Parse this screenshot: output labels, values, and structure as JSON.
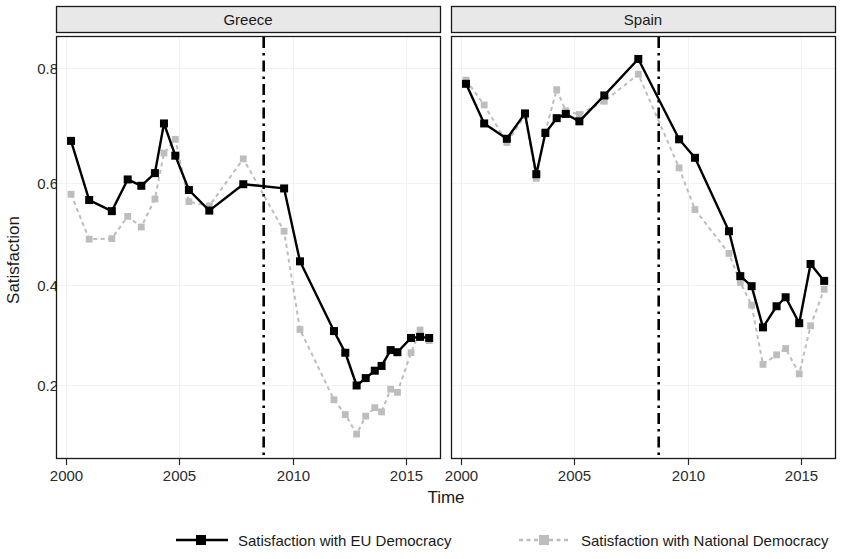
{
  "chart_data": {
    "type": "line",
    "title": "",
    "xlabel": "Time",
    "ylabel": "Satisfaction",
    "xlim": [
      1999.6,
      2016.6
    ],
    "ylim": [
      0.08,
      0.85
    ],
    "yticks": [
      0.2,
      0.4,
      0.6,
      0.8
    ],
    "ytick_labels": [
      "0.2",
      "0.4",
      "0.6",
      "0.8"
    ],
    "xticks": [
      2000,
      2005,
      2010,
      2015
    ],
    "xtick_labels": [
      "2000",
      "2005",
      "2010",
      "2015"
    ],
    "grid": true,
    "legend_position": "bottom",
    "facets": [
      "Greece",
      "Spain"
    ],
    "annotations": [
      {
        "type": "vline",
        "x": 2008.7,
        "style": "dash-dot",
        "color": "#000000",
        "panels": [
          "Greece",
          "Spain"
        ]
      }
    ],
    "panels": [
      {
        "name": "Greece",
        "series": [
          {
            "name": "Satisfaction with EU Democracy",
            "color": "#000000",
            "linestyle": "solid",
            "marker": "square",
            "x": [
              2000.2,
              2001.0,
              2002.0,
              2002.7,
              2003.3,
              2003.9,
              2004.3,
              2004.8,
              2005.4,
              2006.3,
              2007.8,
              2009.6,
              2010.3,
              2011.8,
              2012.3,
              2012.8,
              2013.2,
              2013.6,
              2013.9,
              2014.3,
              2014.6,
              2015.2,
              2015.6,
              2016.0
            ],
            "y": [
              0.663,
              0.551,
              0.53,
              0.59,
              0.578,
              0.602,
              0.696,
              0.635,
              0.57,
              0.531,
              0.581,
              0.573,
              0.435,
              0.303,
              0.262,
              0.2,
              0.214,
              0.228,
              0.237,
              0.267,
              0.263,
              0.29,
              0.292,
              0.29
            ]
          },
          {
            "name": "Satisfaction with National Democracy",
            "color": "#bdbdbd",
            "linestyle": "dashed",
            "marker": "square",
            "x": [
              2000.2,
              2001.0,
              2002.0,
              2002.7,
              2003.3,
              2003.9,
              2004.3,
              2004.8,
              2005.4,
              2006.3,
              2007.8,
              2009.6,
              2010.3,
              2011.8,
              2012.3,
              2012.8,
              2013.2,
              2013.6,
              2013.9,
              2014.3,
              2014.6,
              2015.2,
              2015.6,
              2016.0
            ],
            "y": [
              0.562,
              0.477,
              0.478,
              0.52,
              0.5,
              0.553,
              0.64,
              0.666,
              0.548,
              0.54,
              0.629,
              0.492,
              0.306,
              0.173,
              0.145,
              0.108,
              0.142,
              0.158,
              0.15,
              0.193,
              0.187,
              0.262,
              0.305,
              0.285
            ]
          }
        ]
      },
      {
        "name": "Spain",
        "series": [
          {
            "name": "Satisfaction with EU Democracy",
            "color": "#000000",
            "linestyle": "solid",
            "marker": "square",
            "x": [
              2000.2,
              2001.0,
              2002.0,
              2002.8,
              2003.3,
              2003.7,
              2004.2,
              2004.6,
              2005.2,
              2006.3,
              2007.8,
              2009.6,
              2010.3,
              2011.8,
              2012.3,
              2012.8,
              2013.3,
              2013.9,
              2014.3,
              2014.9,
              2015.4,
              2016.0
            ],
            "y": [
              0.771,
              0.696,
              0.667,
              0.715,
              0.6,
              0.678,
              0.706,
              0.714,
              0.7,
              0.749,
              0.818,
              0.666,
              0.631,
              0.492,
              0.407,
              0.388,
              0.31,
              0.35,
              0.367,
              0.318,
              0.43,
              0.398
            ]
          },
          {
            "name": "Satisfaction with National Democracy",
            "color": "#bdbdbd",
            "linestyle": "dashed",
            "marker": "square",
            "x": [
              2000.2,
              2001.0,
              2002.0,
              2002.8,
              2003.3,
              2003.7,
              2004.2,
              2004.6,
              2005.2,
              2006.3,
              2007.8,
              2009.6,
              2010.3,
              2011.8,
              2012.3,
              2012.8,
              2013.3,
              2013.9,
              2014.3,
              2014.9,
              2015.4,
              2016.0
            ],
            "y": [
              0.778,
              0.731,
              0.66,
              0.711,
              0.592,
              0.681,
              0.76,
              0.72,
              0.713,
              0.738,
              0.789,
              0.612,
              0.533,
              0.45,
              0.395,
              0.352,
              0.24,
              0.258,
              0.27,
              0.222,
              0.313,
              0.382
            ]
          }
        ]
      }
    ]
  },
  "axes": {
    "ylabel": "Satisfaction",
    "xlabel": "Time",
    "ytick_labels": [
      "0.8",
      "0.6",
      "0.4",
      "0.2"
    ],
    "xtick_labels": [
      "2000",
      "2005",
      "2010",
      "2015"
    ]
  },
  "strips": {
    "left": "Greece",
    "right": "Spain"
  },
  "legend": {
    "entries": [
      {
        "label": "Satisfaction with EU Democracy",
        "color": "#000000",
        "style": "solid-square"
      },
      {
        "label": "Satisfaction with National Democracy",
        "color": "#bdbdbd",
        "style": "dotted-square"
      }
    ]
  }
}
